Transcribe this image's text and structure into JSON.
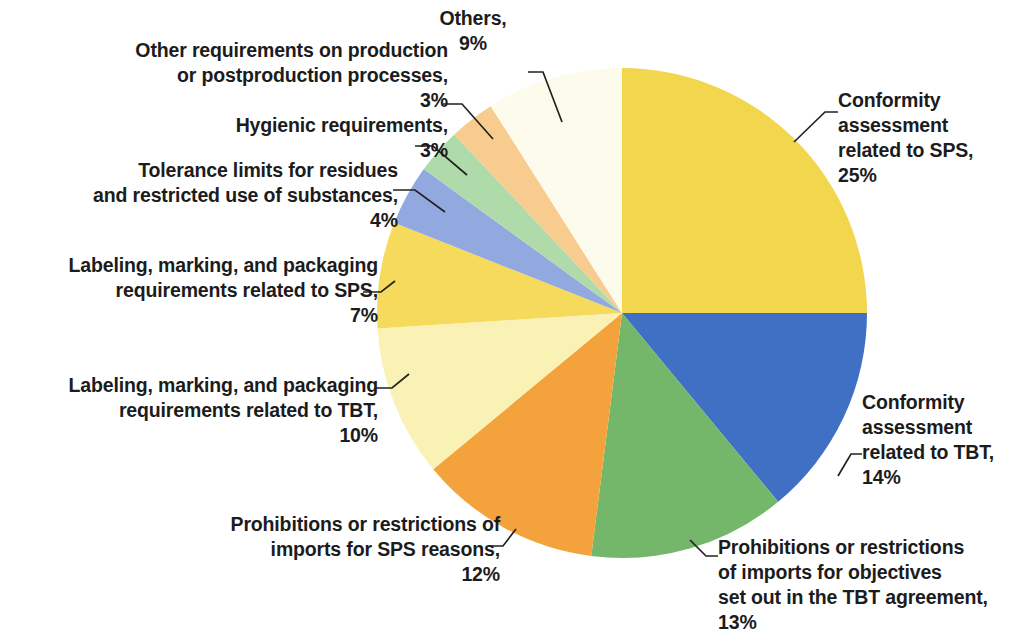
{
  "chart_data": {
    "type": "pie",
    "title": "",
    "subtitle": "",
    "xlabel": "",
    "ylabel": "",
    "legend_position": "none",
    "grid": false,
    "units": "percent",
    "start_angle_deg": 0,
    "direction": "clockwise",
    "categories": [
      "Conformity assessment related to SPS",
      "Conformity assessment related to TBT",
      "Prohibitions or restrictions of imports for objectives set out in the TBT agreement",
      "Prohibitions or restrictions of imports for SPS reasons",
      "Labeling, marking, and packaging requirements related to TBT",
      "Labeling, marking, and packaging requirements related to SPS",
      "Tolerance limits for residues and restricted use of substances",
      "Hygienic requirements",
      "Other requirements on production or postproduction processes",
      "Others"
    ],
    "values": [
      25,
      14,
      13,
      12,
      10,
      7,
      4,
      3,
      3,
      9
    ],
    "colors": [
      "#F2D64E",
      "#3F70C4",
      "#74B66A",
      "#F4A33C",
      "#FAF2B4",
      "#F5DA5B",
      "#92A9DF",
      "#AFDAAA",
      "#F8CB8E",
      "#FDFBEC"
    ]
  },
  "slices": [
    {
      "id": "conformity-sps",
      "label_lines": "Conformity\nassessment\nrelated to SPS,",
      "percent_label": "25%",
      "color": "#F2D64E"
    },
    {
      "id": "conformity-tbt",
      "label_lines": "Conformity\nassessment\nrelated to TBT,",
      "percent_label": "14%",
      "color": "#3F70C4"
    },
    {
      "id": "prohibitions-tbt",
      "label_lines": "Prohibitions or restrictions\nof imports for objectives\nset out in the TBT agreement,",
      "percent_label": "13%",
      "color": "#74B66A"
    },
    {
      "id": "prohibitions-sps",
      "label_lines": "Prohibitions or restrictions of\nimports for SPS reasons,",
      "percent_label": "12%",
      "color": "#F4A33C"
    },
    {
      "id": "labeling-tbt",
      "label_lines": "Labeling, marking, and packaging\nrequirements related to TBT,",
      "percent_label": "10%",
      "color": "#FAF2B4"
    },
    {
      "id": "labeling-sps",
      "label_lines": "Labeling, marking, and packaging\nrequirements related to SPS,",
      "percent_label": "7%",
      "color": "#F5DA5B"
    },
    {
      "id": "tolerance-limits",
      "label_lines": "Tolerance limits for residues\nand restricted use of substances,",
      "percent_label": "4%",
      "color": "#92A9DF"
    },
    {
      "id": "hygienic",
      "label_lines": "Hygienic requirements,",
      "percent_label": "3%",
      "color": "#AFDAAA"
    },
    {
      "id": "other-requirements",
      "label_lines": "Other requirements on production\nor postproduction processes,",
      "percent_label": "3%",
      "color": "#F8CB8E"
    },
    {
      "id": "others",
      "label_lines": "Others,",
      "percent_label": "9%",
      "color": "#FDFBEC"
    }
  ],
  "labels": {
    "others": "Others,\n9%",
    "other_requirements": "Other requirements on production\nor postproduction processes,\n3%",
    "hygienic": "Hygienic requirements,\n3%",
    "tolerance": "Tolerance limits for residues\nand restricted use of substances,\n4%",
    "labeling_sps": "Labeling, marking, and packaging\nrequirements related to SPS,\n7%",
    "labeling_tbt": "Labeling, marking, and packaging\nrequirements related to TBT,\n10%",
    "prohibitions_sps": "Prohibitions or restrictions of\nimports for SPS reasons,\n12%",
    "prohibitions_tbt": "Prohibitions or restrictions\nof imports for objectives\nset out in the TBT agreement,\n13%",
    "conformity_sps": "Conformity\nassessment\nrelated to SPS,\n25%",
    "conformity_tbt": "Conformity\nassessment\nrelated to TBT,\n14%"
  },
  "geometry": {
    "center_x": 622,
    "center_y": 313,
    "radius": 245
  },
  "style": {
    "background": "#FFFFFF",
    "text_color": "#1C1C1C",
    "leader_line_color": "#222222"
  }
}
